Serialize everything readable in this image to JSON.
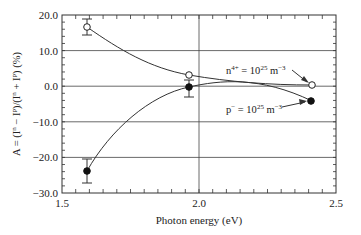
{
  "chart_data": {
    "type": "line",
    "title": "",
    "xlabel": "Photon energy (eV)",
    "ylabel": "A = (Iⁿ − Iᵖ)/(Iⁿ + Iᵖ) (%)",
    "xlim": [
      1.5,
      2.5
    ],
    "ylim": [
      -30.0,
      20.0
    ],
    "xticks": [
      "1.5",
      "2.0",
      "2.5"
    ],
    "yticks": [
      "20.0",
      "10.0",
      "0.0",
      "−10.0",
      "−20.0",
      "−30.0"
    ],
    "grid": "horizontal lines at 10-unit steps, vertical line at 2.0",
    "series": [
      {
        "name": "n4+ = 10^25 m^-3",
        "marker": "open-circle",
        "x": [
          1.59,
          1.96,
          2.41
        ],
        "y": [
          16.5,
          3.2,
          0.3
        ],
        "yerr": [
          2.3,
          0,
          0
        ]
      },
      {
        "name": "p− = 10^25 m^-3",
        "marker": "filled-circle",
        "x": [
          1.59,
          1.96,
          2.41
        ],
        "y": [
          -23.8,
          0.0,
          -4.2
        ],
        "yerr": [
          3.5,
          2.8,
          0
        ]
      }
    ],
    "annotations": [
      {
        "text": "n4+ = 1025 m−3",
        "points_to": "open-circle at 2.41"
      },
      {
        "text": "p− = 1025 m−3",
        "points_to": "filled-circle at 2.41"
      }
    ]
  },
  "labels": {
    "xlabel": "Photon energy (eV)",
    "ylabel_main": "A = (I",
    "n_annot_pre": "n",
    "n_annot_sup": "4+",
    "n_annot_mid": " = 10",
    "n_annot_exp": "25",
    "n_annot_unit": " m",
    "n_annot_unit_exp": "−3",
    "p_annot_pre": "p",
    "p_annot_sup": "−",
    "p_annot_mid": " = 10",
    "p_annot_exp": "25",
    "p_annot_unit": " m",
    "p_annot_unit_exp": "−3",
    "ytick_0": "20.0",
    "ytick_1": "10.0",
    "ytick_2": "0.0",
    "ytick_3": "−10.0",
    "ytick_4": "−20.0",
    "ytick_5": "−30.0",
    "xtick_0": "1.5",
    "xtick_1": "2.0",
    "xtick_2": "2.5"
  }
}
